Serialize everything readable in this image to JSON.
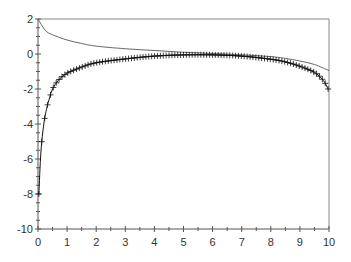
{
  "chart_data": {
    "type": "line",
    "title": "",
    "xlabel": "",
    "ylabel": "",
    "xlim": [
      0,
      10
    ],
    "ylim": [
      -10,
      2
    ],
    "grid": false,
    "legend": null,
    "x_ticks": [
      0,
      1,
      2,
      3,
      4,
      5,
      6,
      7,
      8,
      9,
      10
    ],
    "y_ticks": [
      2,
      0,
      -2,
      -4,
      -6,
      -8,
      -10
    ],
    "series": [
      {
        "name": "curve-1 (thin line)",
        "style": "line",
        "color": "#555555",
        "x": [
          0,
          0.25,
          0.5,
          1,
          1.5,
          2,
          3,
          4,
          5,
          6,
          7,
          8,
          8.5,
          9,
          9.5,
          10
        ],
        "y": [
          2.0,
          1.35,
          1.1,
          0.8,
          0.6,
          0.45,
          0.3,
          0.2,
          0.1,
          0.03,
          -0.05,
          -0.15,
          -0.25,
          -0.4,
          -0.6,
          -0.95
        ]
      },
      {
        "name": "curve-2 (plus markers)",
        "style": "line+markers",
        "marker": "+",
        "color": "#111111",
        "x": [
          0.03,
          0.1,
          0.2,
          0.3,
          0.4,
          0.5,
          0.7,
          1,
          1.5,
          2,
          3,
          4,
          5,
          6,
          7,
          8,
          8.5,
          9,
          9.5,
          9.8,
          9.97
        ],
        "y": [
          -8.0,
          -5.6,
          -4.0,
          -3.1,
          -2.5,
          -2.0,
          -1.5,
          -1.1,
          -0.75,
          -0.5,
          -0.28,
          -0.12,
          -0.05,
          -0.05,
          -0.12,
          -0.3,
          -0.45,
          -0.7,
          -1.05,
          -1.5,
          -2.0
        ]
      }
    ]
  }
}
